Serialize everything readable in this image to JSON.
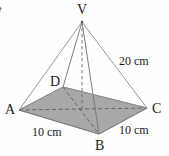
{
  "figure": {
    "type": "square-pyramid-geometry-diagram",
    "colors": {
      "base_fill": "#a8a8a8",
      "edge_stroke": "#8c8c8c",
      "hidden_stroke": "#6f6f6f",
      "label_text": "#1a1a1a",
      "background": "#fefefe"
    },
    "apex": {
      "name": "V",
      "label": "V",
      "x": 82,
      "y": 22
    },
    "base_vertices": [
      {
        "name": "D",
        "label": "D",
        "x": 63,
        "y": 87
      },
      {
        "name": "C",
        "label": "C",
        "x": 147,
        "y": 108
      },
      {
        "name": "B",
        "label": "B",
        "x": 99,
        "y": 134
      },
      {
        "name": "A",
        "label": "A",
        "x": 19,
        "y": 110
      }
    ],
    "labels": {
      "apex": "V",
      "vertex_a": "A",
      "vertex_b": "B",
      "vertex_c": "C",
      "vertex_d": "D",
      "slant_edge": "20 cm",
      "base_edge_left": "10 cm",
      "base_edge_right": "10 cm",
      "clipped_corner_text": "e"
    },
    "measurements": [
      {
        "edge": "VC",
        "value": "20 cm"
      },
      {
        "edge": "AB",
        "value": "10 cm"
      },
      {
        "edge": "BC",
        "value": "10 cm"
      }
    ],
    "edges": [
      {
        "from": "V",
        "to": "A",
        "style": "solid"
      },
      {
        "from": "V",
        "to": "B",
        "style": "solid"
      },
      {
        "from": "V",
        "to": "C",
        "style": "solid"
      },
      {
        "from": "V",
        "to": "D",
        "style": "solid"
      },
      {
        "from": "A",
        "to": "D",
        "style": "solid"
      },
      {
        "from": "D",
        "to": "C",
        "style": "solid"
      },
      {
        "from": "C",
        "to": "B",
        "style": "solid"
      },
      {
        "from": "B",
        "to": "A",
        "style": "solid"
      },
      {
        "from": "A",
        "to": "C",
        "style": "dashed"
      },
      {
        "from": "D",
        "to": "B",
        "style": "dashed"
      },
      {
        "from": "V",
        "to": "center",
        "style": "dashed"
      }
    ]
  }
}
